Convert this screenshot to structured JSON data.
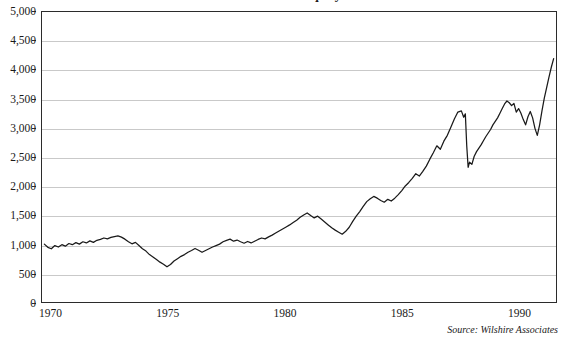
{
  "chart_data": {
    "type": "line",
    "title": "Wilshire 5000 Equity Index",
    "xlabel": "",
    "ylabel": "",
    "xlim": [
      1969.6,
      1991.6
    ],
    "ylim": [
      0,
      5000
    ],
    "grid": true,
    "legend": null,
    "source_note": "Source: Wilshire Associates",
    "y_ticks": [
      0,
      500,
      1000,
      1500,
      2000,
      2500,
      3000,
      3500,
      4000,
      4500,
      5000
    ],
    "y_tick_labels": [
      "0",
      "500",
      "1,000",
      "1,500",
      "2,000",
      "2,500",
      "3,000",
      "3,500",
      "4,000",
      "4,500",
      "5,000"
    ],
    "x_ticks": [
      1970,
      1975,
      1980,
      1985,
      1990
    ],
    "x_tick_labels": [
      "1970",
      "1975",
      "1980",
      "1985",
      "1990"
    ],
    "line_color": "#1a1a1a",
    "series": [
      {
        "name": "Wilshire 5000 Equity Index",
        "x": [
          1969.7,
          1969.85,
          1970.0,
          1970.15,
          1970.3,
          1970.45,
          1970.6,
          1970.75,
          1970.9,
          1971.05,
          1971.2,
          1971.35,
          1971.5,
          1971.65,
          1971.8,
          1971.95,
          1972.1,
          1972.25,
          1972.4,
          1972.55,
          1972.7,
          1972.85,
          1973.0,
          1973.15,
          1973.3,
          1973.45,
          1973.6,
          1973.75,
          1973.9,
          1974.05,
          1974.2,
          1974.35,
          1974.5,
          1974.65,
          1974.8,
          1974.95,
          1975.1,
          1975.25,
          1975.4,
          1975.55,
          1975.7,
          1975.85,
          1976.0,
          1976.15,
          1976.3,
          1976.45,
          1976.6,
          1976.75,
          1976.9,
          1977.05,
          1977.2,
          1977.35,
          1977.5,
          1977.65,
          1977.8,
          1977.95,
          1978.1,
          1978.25,
          1978.4,
          1978.55,
          1978.7,
          1978.85,
          1979.0,
          1979.15,
          1979.3,
          1979.45,
          1979.6,
          1979.75,
          1979.9,
          1980.05,
          1980.2,
          1980.35,
          1980.5,
          1980.65,
          1980.8,
          1980.95,
          1981.1,
          1981.25,
          1981.4,
          1981.55,
          1981.7,
          1981.85,
          1982.0,
          1982.15,
          1982.3,
          1982.45,
          1982.6,
          1982.75,
          1982.9,
          1983.05,
          1983.2,
          1983.35,
          1983.5,
          1983.65,
          1983.8,
          1983.95,
          1984.1,
          1984.25,
          1984.4,
          1984.55,
          1984.7,
          1984.85,
          1985.0,
          1985.15,
          1985.3,
          1985.45,
          1985.6,
          1985.75,
          1985.9,
          1986.05,
          1986.2,
          1986.35,
          1986.5,
          1986.65,
          1986.8,
          1986.95,
          1987.1,
          1987.25,
          1987.4,
          1987.55,
          1987.65,
          1987.72,
          1987.78,
          1987.84,
          1987.9,
          1988.0,
          1988.1,
          1988.2,
          1988.3,
          1988.4,
          1988.5,
          1988.6,
          1988.7,
          1988.8,
          1988.9,
          1989.0,
          1989.1,
          1989.2,
          1989.3,
          1989.4,
          1989.5,
          1989.6,
          1989.7,
          1989.8,
          1989.9,
          1990.0,
          1990.1,
          1990.2,
          1990.3,
          1990.4,
          1990.5,
          1990.6,
          1990.7,
          1990.8,
          1990.9,
          1991.0,
          1991.1,
          1991.2,
          1991.3,
          1991.4,
          1991.5
        ],
        "y": [
          1010,
          955,
          930,
          985,
          960,
          1000,
          975,
          1020,
          1000,
          1035,
          1010,
          1050,
          1030,
          1065,
          1040,
          1075,
          1090,
          1115,
          1100,
          1125,
          1140,
          1150,
          1130,
          1095,
          1050,
          1015,
          1040,
          985,
          930,
          890,
          830,
          790,
          745,
          700,
          665,
          620,
          660,
          720,
          760,
          800,
          830,
          870,
          900,
          935,
          905,
          870,
          900,
          930,
          960,
          985,
          1010,
          1050,
          1075,
          1095,
          1060,
          1080,
          1050,
          1025,
          1055,
          1030,
          1060,
          1090,
          1115,
          1100,
          1135,
          1165,
          1200,
          1235,
          1270,
          1305,
          1340,
          1380,
          1420,
          1470,
          1510,
          1545,
          1500,
          1460,
          1490,
          1440,
          1390,
          1340,
          1290,
          1250,
          1215,
          1180,
          1230,
          1300,
          1400,
          1490,
          1570,
          1660,
          1740,
          1790,
          1830,
          1800,
          1760,
          1730,
          1780,
          1750,
          1800,
          1860,
          1930,
          2010,
          2070,
          2140,
          2220,
          2180,
          2260,
          2350,
          2470,
          2580,
          2700,
          2640,
          2780,
          2880,
          3020,
          3160,
          3280,
          3300,
          3190,
          3250,
          2700,
          2330,
          2420,
          2380,
          2520,
          2600,
          2660,
          2720,
          2790,
          2860,
          2920,
          2980,
          3060,
          3120,
          3180,
          3260,
          3340,
          3420,
          3470,
          3440,
          3390,
          3430,
          3280,
          3340,
          3260,
          3150,
          3060,
          3200,
          3290,
          3180,
          3000,
          2880,
          3060,
          3300,
          3520,
          3700,
          3880,
          4050,
          4200
        ]
      }
    ],
    "annotations": [
      {
        "label": "1974 bear-market trough",
        "x": 1974.95,
        "y": 620
      },
      {
        "label": "1987 crash",
        "x": 1987.84,
        "y": 2330
      },
      {
        "label": "1991 high",
        "x": 1991.5,
        "y": 4720
      }
    ]
  }
}
